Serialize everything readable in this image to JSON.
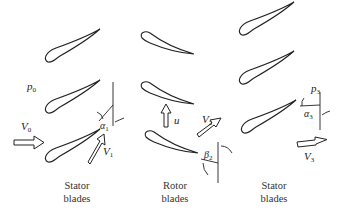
{
  "diagram": {
    "type": "turbomachinery-blade-stages",
    "stages": [
      {
        "id": "stator1",
        "caption_line1": "Stator",
        "caption_line2": "blades",
        "blade_count": 3
      },
      {
        "id": "rotor",
        "caption_line1": "Rotor",
        "caption_line2": "blades",
        "blade_count": 3
      },
      {
        "id": "stator2",
        "caption_line1": "Stator",
        "caption_line2": "blades",
        "blade_count": 3
      }
    ],
    "labels": {
      "p0": {
        "base": "p",
        "sub": "0"
      },
      "V0": {
        "base": "V",
        "sub": "0"
      },
      "alpha1": {
        "base": "α",
        "sub": "1"
      },
      "V1": {
        "base": "V",
        "sub": "1"
      },
      "u": {
        "base": "u",
        "sub": ""
      },
      "V2": {
        "base": "V",
        "sub": "2"
      },
      "beta2": {
        "base": "β",
        "sub": "2"
      },
      "p3": {
        "base": "p",
        "sub": "3"
      },
      "alpha3": {
        "base": "α",
        "sub": "3"
      },
      "V3": {
        "base": "V",
        "sub": "3"
      }
    },
    "colors": {
      "stroke": "#222222",
      "background": "#ffffff"
    }
  }
}
